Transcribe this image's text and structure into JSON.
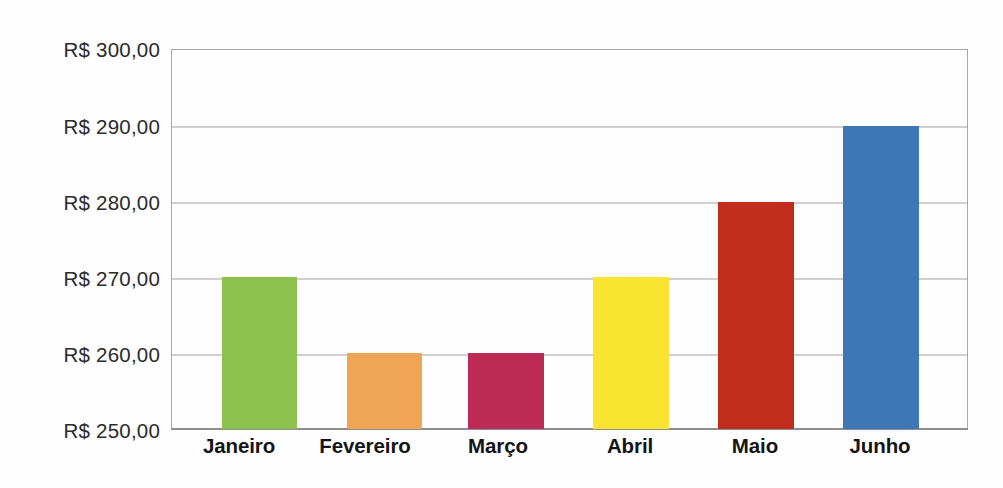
{
  "chart_data": {
    "type": "bar",
    "title": "",
    "subtitle": "",
    "xlabel": "",
    "ylabel": "",
    "categories": [
      "Janeiro",
      "Fevereiro",
      "Março",
      "Abril",
      "Maio",
      "Junho"
    ],
    "values": [
      270,
      260,
      260,
      270,
      280,
      290
    ],
    "value_labels": [
      "R$ 270,00",
      "R$ 260,00",
      "R$ 260,00",
      "R$ 270,00",
      "R$ 280,00",
      "R$ 290,00"
    ],
    "bar_colors": [
      "#8CC14E",
      "#F0A455",
      "#BC2A55",
      "#F9E52F",
      "#C02D1D",
      "#3F77B6"
    ],
    "ylim": [
      250,
      300
    ],
    "ytick_values": [
      300,
      290,
      280,
      270,
      260,
      250
    ],
    "ytick_labels": [
      "R$ 300,00",
      "R$ 290,00",
      "R$ 280,00",
      "R$ 270,00",
      "R$ 260,00",
      "R$ 250,00"
    ],
    "currency_prefix": "R$",
    "decimal_separator": ",",
    "grid": true,
    "grid_axis": "y",
    "legend": false,
    "legend_position": "none",
    "axis_color": "#9F9F9F",
    "frame": true,
    "background_color": "#FEFEFE",
    "label_color": "#2B2B2B"
  },
  "ytick_labels": {
    "t0": "R$ 300,00",
    "t1": "R$ 290,00",
    "t2": "R$ 280,00",
    "t3": "R$ 270,00",
    "t4": "R$ 260,00",
    "t5": "R$ 250,00"
  },
  "xtick_labels": {
    "c0": "Janeiro",
    "c1": "Fevereiro",
    "c2": "Março",
    "c3": "Abril",
    "c4": "Maio",
    "c5": "Junho"
  }
}
